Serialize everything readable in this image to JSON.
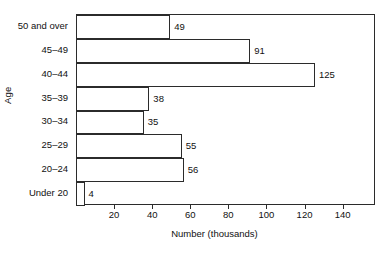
{
  "chart_data": {
    "type": "bar",
    "orientation": "horizontal",
    "title": "",
    "subtitle": "",
    "xlabel": "Number (thousands)",
    "ylabel": "Age",
    "categories": [
      "Under 20",
      "20–24",
      "25–29",
      "30–34",
      "35–39",
      "40–44",
      "45–49",
      "50 and over"
    ],
    "values": [
      4,
      56,
      55,
      35,
      38,
      125,
      91,
      49
    ],
    "data_labels": [
      "4",
      "56",
      "55",
      "35",
      "38",
      "125",
      "91",
      "49"
    ],
    "xlim": [
      0,
      157
    ],
    "xticks": [
      20,
      40,
      60,
      80,
      100,
      120,
      140
    ],
    "xtick_labels": [
      "20",
      "40",
      "60",
      "80",
      "100",
      "120",
      "140"
    ],
    "grid": false,
    "legend": false,
    "legend_position": "none",
    "bar_fill": "#ffffff",
    "bar_edge": "#2b2b2b",
    "axis_color": "#2b2b2b",
    "text_color": "#111111",
    "background": "#ffffff"
  }
}
